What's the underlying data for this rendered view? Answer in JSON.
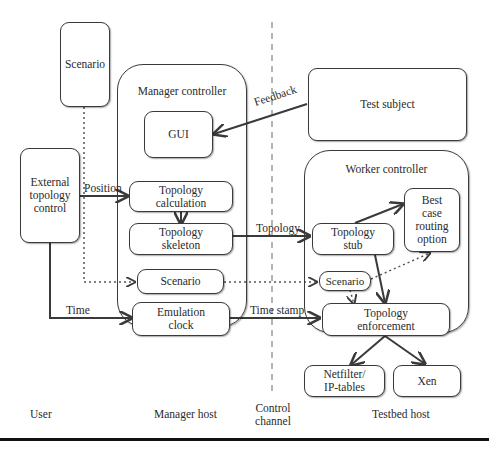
{
  "diagram": {
    "nodes": {
      "scenario_user": "Scenario",
      "external_topology_control": "External topology control",
      "gui": "GUI",
      "topology_calculation": "Topology calculation",
      "topology_skeleton": "Topology skeleton",
      "scenario_manager": "Scenario",
      "emulation_clock": "Emulation clock",
      "test_subject": "Test subject",
      "topology_stub": "Topology stub",
      "best_case_routing_option": "Best case routing option",
      "scenario_worker": "Scenario",
      "topology_enforcement": "Topology enforcement",
      "netfilter_iptables": "Netfilter/ IP-tables",
      "xen": "Xen"
    },
    "containers": {
      "manager_controller": "Manager controller",
      "worker_controller": "Worker controller"
    },
    "edge_labels": {
      "position": "Position",
      "time": "Time",
      "feedback": "Feedback",
      "topology": "Topology",
      "time_stamp": "Time stamp"
    },
    "areas": {
      "user": "User",
      "manager_host": "Manager host",
      "control_channel": "Control channel",
      "testbed_host": "Testbed host"
    },
    "edges": [
      {
        "from": "External topology control",
        "to": "Topology calculation",
        "label": "Position",
        "style": "solid"
      },
      {
        "from": "External topology control",
        "to": "Emulation clock",
        "label": "Time",
        "style": "solid"
      },
      {
        "from": "Scenario",
        "to": "Scenario (Manager)",
        "style": "dotted"
      },
      {
        "from": "Topology calculation",
        "to": "Topology skeleton",
        "style": "solid"
      },
      {
        "from": "Test subject",
        "to": "GUI",
        "label": "Feedback",
        "style": "solid"
      },
      {
        "from": "Topology skeleton",
        "to": "Topology stub",
        "label": "Topology",
        "style": "solid"
      },
      {
        "from": "Scenario (Manager)",
        "to": "Scenario (Worker)",
        "style": "dotted"
      },
      {
        "from": "Emulation clock",
        "to": "Topology enforcement",
        "label": "Time stamp",
        "style": "solid"
      },
      {
        "from": "Topology stub",
        "to": "Best case routing option",
        "style": "solid"
      },
      {
        "from": "Topology stub",
        "to": "Topology enforcement",
        "style": "solid"
      },
      {
        "from": "Scenario (Worker)",
        "to": "Best case routing option",
        "style": "dotted"
      },
      {
        "from": "Scenario (Worker)",
        "to": "Topology enforcement",
        "style": "dotted"
      },
      {
        "from": "Topology enforcement",
        "to": "Netfilter/IP-tables",
        "style": "solid"
      },
      {
        "from": "Topology enforcement",
        "to": "Xen",
        "style": "solid"
      }
    ]
  }
}
